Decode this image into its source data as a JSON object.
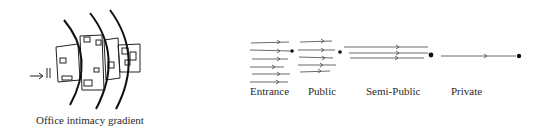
{
  "left_figure": {
    "caption": "Office intimacy gradient",
    "entry_arrow": "entry-arrow",
    "arc_count": 3
  },
  "right_figure": {
    "zones": [
      {
        "label": "Entrance",
        "arrow_count": 6
      },
      {
        "label": "Public",
        "arrow_count": 5
      },
      {
        "label": "Semi-Public",
        "arrow_count": 3
      },
      {
        "label": "Private",
        "arrow_count": 1
      }
    ]
  },
  "colors": {
    "ink": "#111111",
    "background": "#ffffff"
  }
}
